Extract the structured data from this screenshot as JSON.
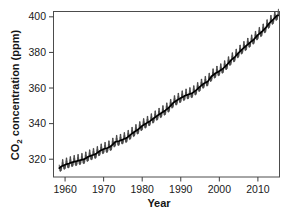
{
  "figure": {
    "background_color": "#ffffff",
    "frame_color": "#4c4c4c"
  },
  "chart_data": {
    "type": "line",
    "title": "",
    "subtitle": "",
    "xlabel": "Year",
    "ylabel": "CO2 concentration (ppm)",
    "ylabel_parts": {
      "prefix": "CO",
      "subscript": "2",
      "suffix": " concentration (ppm)"
    },
    "xlim": [
      1957.0,
      2015.6
    ],
    "ylim": [
      310.0,
      403.0
    ],
    "xticks": [
      1960,
      1970,
      1980,
      1990,
      2000,
      2010
    ],
    "xtick_labels": [
      "1960",
      "1970",
      "1980",
      "1990",
      "2000",
      "2010"
    ],
    "yticks": [
      320,
      340,
      360,
      380,
      400
    ],
    "ytick_labels": [
      "320",
      "340",
      "360",
      "380",
      "400"
    ],
    "grid": false,
    "legend": false,
    "legend_position": "none",
    "series": [
      {
        "name": "Monthly mean CO2 (seasonal cycle)",
        "color": "#3a3a3a",
        "style": "sawtooth-band",
        "seasonal_amplitude_ppm": 3.1
      },
      {
        "name": "Trend (annual mean CO2)",
        "color": "#000000",
        "style": "solid",
        "x": [
          1958.5,
          1959,
          1960,
          1961,
          1962,
          1963,
          1964,
          1965,
          1966,
          1967,
          1968,
          1969,
          1970,
          1971,
          1972,
          1973,
          1974,
          1975,
          1976,
          1977,
          1978,
          1979,
          1980,
          1981,
          1982,
          1983,
          1984,
          1985,
          1986,
          1987,
          1988,
          1989,
          1990,
          1991,
          1992,
          1993,
          1994,
          1995,
          1996,
          1997,
          1998,
          1999,
          2000,
          2001,
          2002,
          2003,
          2004,
          2005,
          2006,
          2007,
          2008,
          2009,
          2010,
          2011,
          2012,
          2013,
          2014,
          2015
        ],
        "values": [
          315.0,
          315.9,
          316.9,
          317.6,
          318.4,
          318.9,
          319.5,
          320.0,
          321.4,
          322.2,
          323.0,
          324.6,
          325.7,
          326.3,
          327.5,
          329.7,
          330.2,
          331.1,
          332.0,
          333.8,
          335.4,
          336.8,
          338.8,
          340.1,
          341.4,
          343.0,
          344.6,
          346.0,
          347.4,
          349.2,
          351.6,
          353.1,
          354.4,
          355.6,
          356.4,
          357.1,
          358.8,
          360.8,
          362.6,
          363.7,
          366.6,
          368.3,
          369.5,
          371.0,
          373.1,
          375.6,
          377.4,
          379.8,
          381.9,
          383.8,
          385.6,
          387.4,
          389.9,
          391.6,
          393.8,
          396.5,
          398.6,
          400.8
        ]
      }
    ]
  }
}
